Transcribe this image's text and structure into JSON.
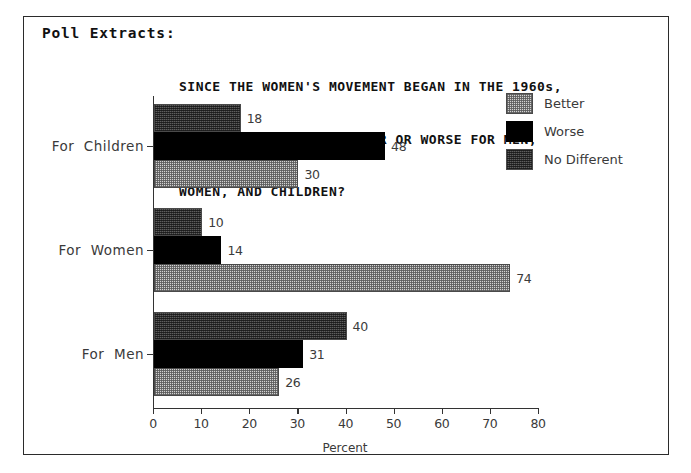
{
  "panel": {
    "header": "Poll Extracts:"
  },
  "chart_data": {
    "type": "bar",
    "orientation": "horizontal",
    "title": "SINCE THE WOMEN'S MOVEMENT BEGAN IN THE 1960s,\nHAS IT MADE THINGS BETTER OR WORSE FOR MEN,\nWOMEN, AND CHILDREN?",
    "title_lines": [
      "SINCE THE WOMEN'S MOVEMENT BEGAN IN THE 1960s,",
      "HAS IT MADE THINGS BETTER OR WORSE FOR MEN,",
      "WOMEN, AND CHILDREN?"
    ],
    "categories": [
      "For  Children",
      "For  Women",
      "For  Men"
    ],
    "series": [
      {
        "name": "No Different",
        "values": [
          18,
          10,
          40
        ],
        "color": "#5e5e5e",
        "pattern": "dense-hatch"
      },
      {
        "name": "Worse",
        "values": [
          48,
          14,
          31
        ],
        "color": "#000000",
        "pattern": "solid"
      },
      {
        "name": "Better",
        "values": [
          30,
          74,
          26
        ],
        "color": "#d2d2d2",
        "pattern": "checker"
      }
    ],
    "legend": [
      {
        "label": "Better",
        "swatch": "better"
      },
      {
        "label": "Worse",
        "swatch": "worse"
      },
      {
        "label": "No Different",
        "swatch": "nodiff"
      }
    ],
    "legend_position": "top-right",
    "xlabel": "Percent",
    "ylabel": "",
    "xlim": [
      0,
      80
    ],
    "xticks": [
      0,
      10,
      20,
      30,
      40,
      50,
      60,
      70,
      80
    ],
    "xtick_labels": [
      "0",
      "10",
      "20",
      "30",
      "40",
      "50",
      "60",
      "70",
      "80"
    ],
    "grid": false
  }
}
